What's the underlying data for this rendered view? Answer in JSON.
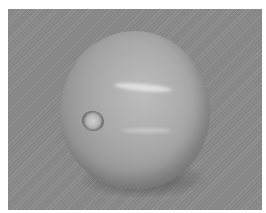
{
  "image": {
    "subject": "grayscale photo of a round fruit (tomato) with stem scar",
    "colors": {
      "page_background": "#ffffff",
      "photo_background": "#8c8c8c",
      "fruit_light": "#bdbdbd",
      "fruit_dark": "#7d7d7d"
    }
  }
}
